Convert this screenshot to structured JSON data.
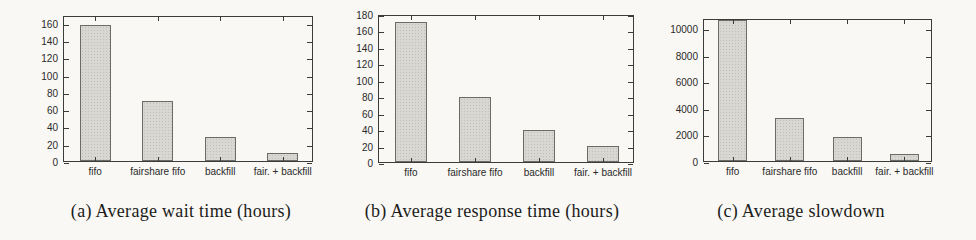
{
  "page": {
    "background": "#f9f8f5"
  },
  "colors": {
    "bar_fill": "#d8d7d2",
    "bar_border": "#6b6b68",
    "axis": "#3c3c3a",
    "tick_text": "#2a2a28",
    "caption_text": "#1c1c1a"
  },
  "chart_data": [
    {
      "type": "bar",
      "title": "(a) Average wait time (hours)",
      "categories": [
        "fifo",
        "fairshare fifo",
        "backfill",
        "fair. + backfill"
      ],
      "values": [
        160,
        70,
        28,
        9
      ],
      "xlabel": "",
      "ylabel": "",
      "ylim": [
        0,
        169
      ],
      "yticks": [
        0,
        20,
        40,
        60,
        80,
        100,
        120,
        140,
        160
      ],
      "grid": false,
      "legend": "none"
    },
    {
      "type": "bar",
      "title": "(b) Average response time (hours)",
      "categories": [
        "fifo",
        "fairshare fifo",
        "backfill",
        "fair. + backfill"
      ],
      "values": [
        172,
        80,
        40,
        20
      ],
      "xlabel": "",
      "ylabel": "",
      "ylim": [
        0,
        180
      ],
      "yticks": [
        0,
        20,
        40,
        60,
        80,
        100,
        120,
        140,
        160,
        180
      ],
      "grid": false,
      "legend": "none"
    },
    {
      "type": "bar",
      "title": "(c) Average slowdown",
      "categories": [
        "fifo",
        "fairshare fifo",
        "backfill",
        "fair. + backfill"
      ],
      "values": [
        11000,
        3300,
        1800,
        500
      ],
      "xlabel": "",
      "ylabel": "",
      "ylim": [
        0,
        10750
      ],
      "yticks": [
        0,
        2000,
        4000,
        6000,
        8000,
        10000
      ],
      "grid": false,
      "legend": "none",
      "note": "fifo bar is clipped at the top of the y-axis"
    }
  ]
}
